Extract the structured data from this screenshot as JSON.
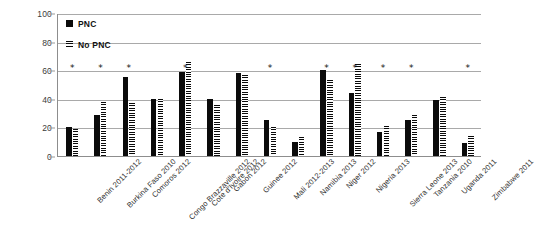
{
  "chart_data": {
    "type": "bar",
    "title": "",
    "subtitle": "",
    "xlabel": "",
    "ylabel": "",
    "ylim": [
      0,
      100
    ],
    "yticks": [
      0,
      20,
      40,
      60,
      80,
      100
    ],
    "grid": true,
    "legend_position": "top-left",
    "categories": [
      "Benin 2011-2012",
      "Burkina Faso 2010",
      "Comoros 2012",
      "Congo Brazzaville 2012",
      "Cote d'Ivoire 2012",
      "Gabon 2012",
      "Guinee 2012",
      "Mali 2012-2013",
      "Namibia 2013",
      "Niger 2012",
      "Nigeria 2013",
      "Sierra Leone 2013",
      "Tanzania 2010",
      "Uganda 2011",
      "Zimbabwe 2011"
    ],
    "series": [
      {
        "name": "PNC",
        "style": "solid-black",
        "values": [
          20,
          29,
          55,
          40,
          59,
          40,
          58,
          25,
          10,
          60,
          44,
          17,
          25,
          39,
          9
        ]
      },
      {
        "name": "No PNC",
        "style": "horizontal-hatch",
        "values": [
          19,
          38,
          37,
          40,
          66,
          36,
          57,
          20,
          13,
          53,
          64,
          21,
          29,
          41,
          14
        ]
      }
    ],
    "annotations": {
      "marker": "*",
      "marker_y_value": 65,
      "marked_categories": [
        "Benin 2011-2012",
        "Burkina Faso 2010",
        "Comoros 2012",
        "Cote d'Ivoire 2012",
        "Mali 2012-2013",
        "Niger 2012",
        "Nigeria 2013",
        "Sierra Leone 2013",
        "Tanzania 2010",
        "Zimbabwe 2011"
      ]
    },
    "colors": {
      "series_pnc": "#0b0b0b",
      "series_nopnc": "#0b0b0b",
      "gridline": "#a9a9a9",
      "axis": "#8d8d8d",
      "text": "#2f2f2f",
      "background": "#ffffff"
    }
  },
  "legend": {
    "items": [
      {
        "label": "PNC"
      },
      {
        "label": "No PNC"
      }
    ]
  }
}
